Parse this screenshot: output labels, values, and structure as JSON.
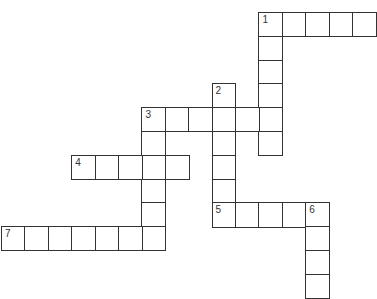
{
  "puzzle": {
    "type": "crossword",
    "colors": {
      "line": "#333333",
      "background": "#ffffff",
      "number": "#333333"
    },
    "grid": {
      "origin_x": 1,
      "origin_y": 12,
      "cell_w": 23.4,
      "cell_h": 23.8
    },
    "entries": [
      {
        "number": "1",
        "direction": "across",
        "row": 0,
        "col": 11,
        "length": 5
      },
      {
        "number": "1",
        "direction": "down",
        "row": 0,
        "col": 11,
        "length": 6
      },
      {
        "number": "2",
        "direction": "down",
        "row": 3,
        "col": 9,
        "length": 6
      },
      {
        "number": "3",
        "direction": "across",
        "row": 4,
        "col": 6,
        "length": 6
      },
      {
        "number": "3",
        "direction": "down",
        "row": 4,
        "col": 6,
        "length": 6
      },
      {
        "number": "4",
        "direction": "across",
        "row": 6,
        "col": 3,
        "length": 5
      },
      {
        "number": "5",
        "direction": "across",
        "row": 8,
        "col": 9,
        "length": 5
      },
      {
        "number": "6",
        "direction": "down",
        "row": 8,
        "col": 13,
        "length": 4
      },
      {
        "number": "7",
        "direction": "across",
        "row": 9,
        "col": 0,
        "length": 7
      }
    ]
  }
}
